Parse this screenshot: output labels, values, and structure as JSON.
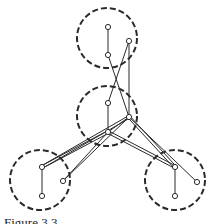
{
  "caption": "Figure 3.3",
  "colors": {
    "stroke": "#2a2a2a",
    "background": "#ffffff",
    "node_fill": "#ffffff"
  },
  "clusters": [
    {
      "id": "top",
      "cx": 107,
      "cy": 38,
      "r": 30
    },
    {
      "id": "middle",
      "cx": 107,
      "cy": 116,
      "r": 30
    },
    {
      "id": "bottom-left",
      "cx": 40,
      "cy": 180,
      "r": 30
    },
    {
      "id": "bottom-right",
      "cx": 175,
      "cy": 180,
      "r": 30
    }
  ],
  "nodes": [
    {
      "id": "t1",
      "x": 108,
      "y": 27
    },
    {
      "id": "t2",
      "x": 108,
      "y": 55
    },
    {
      "id": "t3",
      "x": 129,
      "y": 41
    },
    {
      "id": "m1",
      "x": 108,
      "y": 103
    },
    {
      "id": "m2",
      "x": 129,
      "y": 117
    },
    {
      "id": "m3",
      "x": 108,
      "y": 132
    },
    {
      "id": "l1",
      "x": 42,
      "y": 167
    },
    {
      "id": "l2",
      "x": 63,
      "y": 181
    },
    {
      "id": "l3",
      "x": 42,
      "y": 196
    },
    {
      "id": "r1",
      "x": 175,
      "y": 167
    },
    {
      "id": "r2",
      "x": 197,
      "y": 182
    },
    {
      "id": "r3",
      "x": 175,
      "y": 196
    }
  ],
  "edges": [
    {
      "from": "t1",
      "to": "t2",
      "double": false
    },
    {
      "from": "t2",
      "to": "m2",
      "double": false
    },
    {
      "from": "t3",
      "to": "m1",
      "double": false
    },
    {
      "from": "t3",
      "to": "m2",
      "double": false
    },
    {
      "from": "m1",
      "to": "m3",
      "double": false
    },
    {
      "from": "m2",
      "to": "m3",
      "double": false
    },
    {
      "from": "m2",
      "to": "l1",
      "double": true
    },
    {
      "from": "m3",
      "to": "l1",
      "double": true
    },
    {
      "from": "m2",
      "to": "l2",
      "double": false
    },
    {
      "from": "m3",
      "to": "l2",
      "double": false
    },
    {
      "from": "m2",
      "to": "r1",
      "double": true
    },
    {
      "from": "m2",
      "to": "r2",
      "double": false
    },
    {
      "from": "m3",
      "to": "r1",
      "double": true
    },
    {
      "from": "l1",
      "to": "l3",
      "double": false
    },
    {
      "from": "r1",
      "to": "r3",
      "double": false
    }
  ]
}
